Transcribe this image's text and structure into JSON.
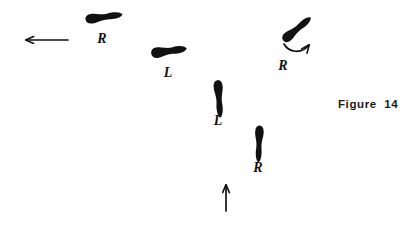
{
  "figure": {
    "caption": "Figure  14",
    "background_color": "#ffffff",
    "ink_color": "#111111",
    "width": 420,
    "height": 231
  },
  "footprints": [
    {
      "id": "footprint-top-left",
      "label": "R",
      "foot": "right",
      "orientation": "horizontal-left",
      "rotation_deg": -8,
      "center_x": 104,
      "center_y": 17,
      "length": 38,
      "width": 15,
      "label_x": 102,
      "label_y": 43
    },
    {
      "id": "footprint-second",
      "label": "L",
      "foot": "left",
      "orientation": "horizontal-left",
      "rotation_deg": -8,
      "center_x": 169,
      "center_y": 51,
      "length": 42,
      "width": 14,
      "label_x": 168,
      "label_y": 77
    },
    {
      "id": "footprint-middle",
      "label": "L",
      "foot": "left",
      "orientation": "vertical-up",
      "rotation_deg": 0,
      "center_x": 219,
      "center_y": 99,
      "length": 38,
      "width": 14,
      "label_x": 218,
      "label_y": 125
    },
    {
      "id": "footprint-bottom",
      "label": "R",
      "foot": "right",
      "orientation": "vertical-up",
      "rotation_deg": 0,
      "center_x": 259,
      "center_y": 144,
      "length": 37,
      "width": 13,
      "label_x": 258,
      "label_y": 172
    },
    {
      "id": "footprint-pivot",
      "label": "R",
      "foot": "right",
      "orientation": "diagonal-pivot",
      "rotation_deg": -45,
      "center_x": 297,
      "center_y": 29,
      "length": 36,
      "width": 15,
      "label_x": 283,
      "label_y": 70
    }
  ],
  "arrows": [
    {
      "id": "arrow-exit-left",
      "direction": "left",
      "from_x": 68,
      "from_y": 40,
      "to_x": 17,
      "to_y": 40
    },
    {
      "id": "arrow-entry-up",
      "direction": "up",
      "from_x": 226,
      "from_y": 211,
      "to_x": 226,
      "to_y": 176
    },
    {
      "id": "arrow-pivot-turn",
      "direction": "curved-clockwise",
      "start_x": 284,
      "start_y": 44,
      "end_x": 315,
      "end_y": 34
    }
  ]
}
